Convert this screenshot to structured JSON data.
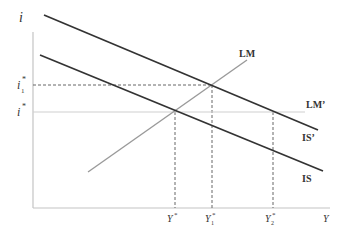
{
  "diagram": {
    "type": "IS-LM model",
    "axes": {
      "y_label": "i",
      "x_label": "Y",
      "origin": [
        33,
        208
      ],
      "y_axis_top": 32,
      "x_axis_right": 330
    },
    "curves": [
      {
        "name": "IS'",
        "label": "IS’",
        "from": [
          44,
          15
        ],
        "to": [
          318,
          130
        ],
        "color": "#333333",
        "width": 1.6,
        "label_pos": [
          273,
          158
        ]
      },
      {
        "name": "IS",
        "label": "IS",
        "from": [
          40,
          55
        ],
        "to": [
          323,
          171
        ],
        "color": "#333333",
        "width": 1.6,
        "label_pos": [
          273,
          206
        ]
      },
      {
        "name": "LM",
        "label": "LM",
        "from": [
          88,
          172
        ],
        "to": [
          247,
          60
        ],
        "color": "#9a9a9a",
        "width": 1.3,
        "label_pos": [
          238,
          56
        ]
      },
      {
        "name": "LM'",
        "label": "LM’",
        "from": [
          33,
          112
        ],
        "to": [
          305,
          112
        ],
        "color": "#c8c8c8",
        "width": 1.0,
        "label_pos": [
          305,
          108
        ]
      }
    ],
    "guides": {
      "horizontal": [
        {
          "y": 85,
          "x_from": 33,
          "x_to": 212,
          "dashed": true
        }
      ],
      "vertical": [
        {
          "x": 175,
          "y_from": 112,
          "y_to": 208,
          "dashed": true
        },
        {
          "x": 212,
          "y_from": 85,
          "y_to": 208,
          "dashed": true
        },
        {
          "x": 273,
          "y_from": 112,
          "y_to": 208,
          "dashed": true
        }
      ]
    },
    "y_ticks": [
      {
        "label": "i",
        "sub": "1",
        "sup": "*",
        "y": 85
      },
      {
        "label": "i",
        "sub": "",
        "sup": "*",
        "y": 112
      }
    ],
    "x_ticks": [
      {
        "label": "Y",
        "sub": "",
        "sup": "*",
        "x": 175
      },
      {
        "label": "Y",
        "sub": "1",
        "sup": "*",
        "x": 212
      },
      {
        "label": "Y",
        "sub": "2",
        "sup": "*",
        "x": 273
      }
    ]
  },
  "labels": {
    "i_axis": "i",
    "y_axis": "Y",
    "is_prime": "IS’",
    "is": "IS",
    "lm": "LM",
    "lm_prime": "LM’",
    "i1_star": "i",
    "i1_sub": "1",
    "i_star": "i",
    "star": "*",
    "Y_star": "Y",
    "Y1_star": "Y",
    "Y1_sub": "1",
    "Y2_star": "Y",
    "Y2_sub": "2"
  }
}
